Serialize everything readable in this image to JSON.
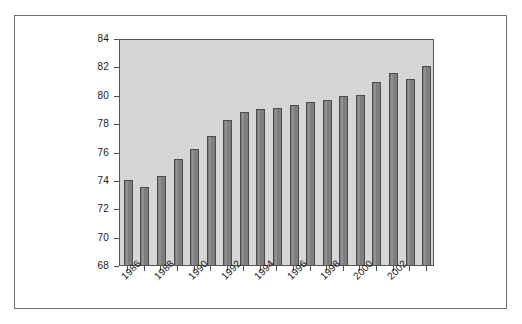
{
  "figure": {
    "background_color": "#ffffff",
    "frame_color": "#6f6f6f",
    "plot_background_color": "#d6d6d6",
    "bar_color": "#7e7e7e",
    "bar_outline_color": "#4b4b4b",
    "axis_color": "#4b4b4b",
    "text_color": "#1a1a1a"
  },
  "chart_data": {
    "type": "bar",
    "title": "",
    "subtitle": "",
    "xlabel": "",
    "ylabel": "",
    "ylim": [
      68,
      84
    ],
    "ytick_labels": [
      "68",
      "70",
      "72",
      "74",
      "76",
      "78",
      "80",
      "82",
      "84"
    ],
    "ytick_values": [
      68,
      70,
      72,
      74,
      76,
      78,
      80,
      82,
      84
    ],
    "grid": false,
    "legend": false,
    "legend_position": "none",
    "xtick_labels": [
      "1986",
      "1988",
      "1990",
      "1992",
      "1994",
      "1996",
      "1998",
      "2000",
      "2002"
    ],
    "xtick_label_rotation": -45,
    "xtick_label_interval": 2,
    "categories": [
      "1986",
      "1987",
      "1988",
      "1989",
      "1990",
      "1991",
      "1992",
      "1993",
      "1994",
      "1995",
      "1996",
      "1997",
      "1998",
      "1999",
      "2000",
      "2001",
      "2002",
      "2003",
      "2004"
    ],
    "values": [
      74.0,
      73.5,
      74.3,
      75.5,
      76.2,
      77.1,
      78.2,
      78.8,
      79.0,
      79.1,
      79.3,
      79.5,
      79.6,
      79.9,
      80.0,
      80.9,
      81.5,
      81.1,
      82.0
    ],
    "series": [
      {
        "name": "",
        "values": [
          74.0,
          73.5,
          74.3,
          75.5,
          76.2,
          77.1,
          78.2,
          78.8,
          79.0,
          79.1,
          79.3,
          79.5,
          79.6,
          79.9,
          80.0,
          80.9,
          81.5,
          81.1,
          82.0
        ]
      }
    ]
  }
}
